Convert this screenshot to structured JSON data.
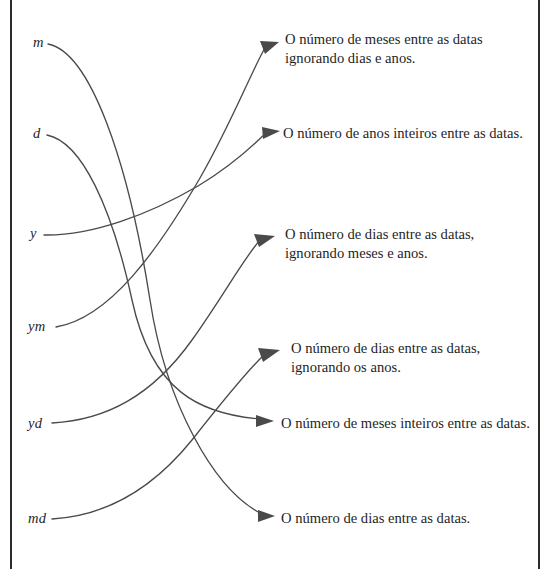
{
  "diagram": {
    "type": "matching-exercise",
    "language": "pt-BR",
    "stroke_color": "#4a4a4a",
    "text_color": "#1f1f1f",
    "rule_color": "#2b2b2b",
    "background": "#ffffff",
    "left_column": {
      "name": "unit-codes",
      "items": [
        {
          "id": "m",
          "label": "m",
          "x": 33,
          "y": 42
        },
        {
          "id": "d",
          "label": "d",
          "x": 33,
          "y": 133
        },
        {
          "id": "y",
          "label": "y",
          "x": 30,
          "y": 233
        },
        {
          "id": "ym",
          "label": "ym",
          "x": 28,
          "y": 326
        },
        {
          "id": "yd",
          "label": "yd",
          "x": 28,
          "y": 423
        },
        {
          "id": "md",
          "label": "md",
          "x": 28,
          "y": 518
        }
      ]
    },
    "right_column": {
      "name": "descriptions",
      "items": [
        {
          "id": "r1",
          "label": "O número de meses entre as datas\nignorando dias e anos.",
          "x": 285,
          "y": 30,
          "arrow_x": 281,
          "arrow_y": 42
        },
        {
          "id": "r2",
          "label": "O número de anos inteiros entre as datas.",
          "x": 283,
          "y": 124,
          "arrow_x": 281,
          "arrow_y": 131
        },
        {
          "id": "r3",
          "label": "O número de dias entre as datas,\nignorando meses e anos.",
          "x": 285,
          "y": 225,
          "arrow_x": 278,
          "arrow_y": 237
        },
        {
          "id": "r4",
          "label": "O número de dias entre as datas,\nignorando os anos.",
          "x": 291,
          "y": 339,
          "arrow_x": 283,
          "arrow_y": 351
        },
        {
          "id": "r5",
          "label": "O número de meses inteiros entre as datas.",
          "x": 281,
          "y": 414,
          "arrow_x": 276,
          "arrow_y": 421
        },
        {
          "id": "r6",
          "label": "O número de dias entre as datas.",
          "x": 281,
          "y": 509,
          "arrow_x": 276,
          "arrow_y": 516
        }
      ]
    },
    "connections": [
      {
        "from": "m",
        "to": "r6",
        "path": "M 48 44 C 90 52 128 160 150 300 C 166 404 214 490 262 514",
        "head": "258,510 275,516 258,522"
      },
      {
        "from": "d",
        "to": "r5",
        "path": "M 47 135 C 82 142 112 208 132 300 C 152 392 200 414 260 419",
        "head": "256,415 274,421 256,427"
      },
      {
        "from": "y",
        "to": "r2",
        "path": "M 44 235 C 92 236 150 214 198 186 C 238 162 256 142 266 133",
        "head": "262,127 280,131 263,139"
      },
      {
        "from": "ym",
        "to": "r1",
        "path": "M 56 327 C 110 318 158 250 200 178 C 232 122 252 70 266 46",
        "head": "260,41 279,42 265,54"
      },
      {
        "from": "yd",
        "to": "r3",
        "path": "M 52 423 C 106 420 152 396 192 340 C 222 298 244 258 260 240",
        "head": "254,234 275,236 259,247"
      },
      {
        "from": "md",
        "to": "r4",
        "path": "M 52 519 C 104 516 150 492 192 440 C 222 402 248 370 264 355",
        "head": "258,348 280,350 263,362"
      }
    ]
  }
}
